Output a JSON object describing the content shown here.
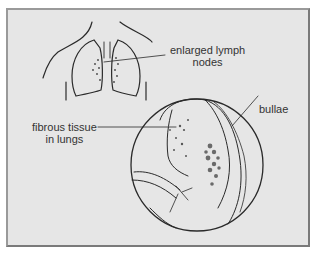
{
  "figure": {
    "colors": {
      "background": "#e6e6e6",
      "line": "#2a2a2a",
      "frame": "#7a7a7a",
      "text": "#333333"
    },
    "labels": {
      "lymph_line1": "enlarged lymph",
      "lymph_line2": "nodes",
      "bullae": "bullae",
      "fibrous_line1": "fibrous tissue",
      "fibrous_line2": "in lungs"
    }
  }
}
